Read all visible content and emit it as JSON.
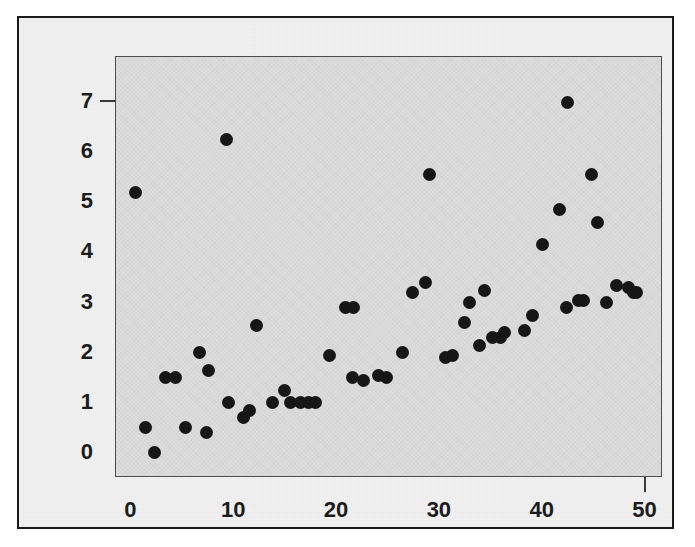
{
  "chart_data": {
    "type": "scatter",
    "title": "",
    "subtitle": "",
    "xlabel": "",
    "ylabel": "",
    "xlim": [
      -1.5,
      51.7
    ],
    "ylim": [
      -0.5,
      7.9
    ],
    "xticks": [
      0,
      10,
      20,
      30,
      40,
      50
    ],
    "yticks": [
      0,
      1,
      2,
      3,
      4,
      5,
      6,
      7
    ],
    "xtick_labels": [
      "0",
      "10",
      "20",
      "30",
      "40",
      "50"
    ],
    "ytick_labels": [
      "0",
      "1",
      "2",
      "3",
      "4",
      "5",
      "6",
      "7"
    ],
    "grid": false,
    "legend": null,
    "marker": "filled-circle",
    "marker_color": "#161616",
    "plot_background": "#dcdcdc",
    "figure_background": "#f2f2f2",
    "frame_color": "#4d4d4d",
    "annotations": [],
    "series": [
      {
        "name": "observations",
        "points": [
          [
            0.4,
            5.2
          ],
          [
            1.4,
            0.5
          ],
          [
            2.2,
            0.0
          ],
          [
            3.3,
            1.5
          ],
          [
            4.3,
            1.5
          ],
          [
            5.3,
            0.5
          ],
          [
            6.6,
            2.0
          ],
          [
            7.3,
            0.4
          ],
          [
            7.5,
            1.65
          ],
          [
            9.2,
            6.25
          ],
          [
            9.4,
            1.0
          ],
          [
            10.9,
            0.7
          ],
          [
            11.5,
            0.85
          ],
          [
            12.2,
            2.55
          ],
          [
            13.7,
            1.0
          ],
          [
            14.9,
            1.25
          ],
          [
            15.5,
            1.0
          ],
          [
            16.4,
            1.0
          ],
          [
            17.2,
            1.0
          ],
          [
            17.9,
            1.0
          ],
          [
            19.3,
            1.95
          ],
          [
            20.8,
            2.9
          ],
          [
            21.6,
            2.9
          ],
          [
            21.5,
            1.5
          ],
          [
            22.6,
            1.45
          ],
          [
            24.0,
            1.55
          ],
          [
            24.8,
            1.5
          ],
          [
            26.4,
            2.0
          ],
          [
            27.3,
            3.2
          ],
          [
            28.6,
            3.4
          ],
          [
            29.0,
            5.55
          ],
          [
            30.5,
            1.9
          ],
          [
            31.2,
            1.95
          ],
          [
            32.4,
            2.6
          ],
          [
            32.9,
            3.0
          ],
          [
            33.9,
            2.15
          ],
          [
            34.3,
            3.25
          ],
          [
            35.1,
            2.3
          ],
          [
            35.9,
            2.3
          ],
          [
            36.3,
            2.4
          ],
          [
            38.2,
            2.45
          ],
          [
            39.0,
            2.75
          ],
          [
            40.0,
            4.15
          ],
          [
            41.6,
            4.85
          ],
          [
            42.4,
            7.0
          ],
          [
            42.3,
            2.9
          ],
          [
            43.5,
            3.05
          ],
          [
            44.0,
            3.05
          ],
          [
            44.7,
            5.55
          ],
          [
            45.3,
            4.6
          ],
          [
            46.2,
            3.0
          ],
          [
            47.2,
            3.35
          ],
          [
            48.3,
            3.3
          ],
          [
            48.8,
            3.2
          ],
          [
            49.1,
            3.2
          ]
        ]
      }
    ]
  },
  "axes": {
    "y_ticks": [
      {
        "label": "7",
        "value": 7
      },
      {
        "label": "6",
        "value": 6
      },
      {
        "label": "5",
        "value": 5
      },
      {
        "label": "4",
        "value": 4
      },
      {
        "label": "3",
        "value": 3
      },
      {
        "label": "2",
        "value": 2
      },
      {
        "label": "1",
        "value": 1
      },
      {
        "label": "0",
        "value": 0
      }
    ],
    "x_ticks": [
      {
        "label": "0",
        "value": 0
      },
      {
        "label": "10",
        "value": 10
      },
      {
        "label": "20",
        "value": 20
      },
      {
        "label": "30",
        "value": 30
      },
      {
        "label": "40",
        "value": 40
      },
      {
        "label": "50",
        "value": 50
      }
    ]
  }
}
